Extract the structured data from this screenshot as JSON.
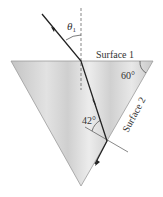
{
  "diagram": {
    "type": "prism-refraction",
    "labels": {
      "theta1": "θ",
      "theta1_sub": "1",
      "surface1": "Surface 1",
      "surface2": "Surface 2",
      "apex_angle": "60°",
      "internal_angle": "42°"
    },
    "colors": {
      "prism_light": "#e6e6e6",
      "prism_dark": "#b8b8b8",
      "ray": "#222222",
      "normal": "#555555",
      "text": "#333333"
    }
  }
}
